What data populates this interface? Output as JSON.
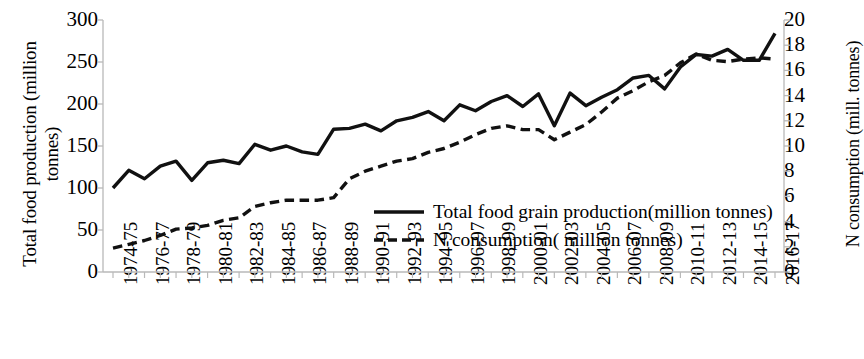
{
  "chart_data": {
    "type": "line",
    "title": "",
    "xlabel": "",
    "ylabel": "Total food production (million tonnes)",
    "y2label": "N consumption (mill. tonnes)",
    "ylim": [
      0,
      300
    ],
    "y2lim": [
      0,
      20
    ],
    "yticks": [
      300,
      250,
      200,
      150,
      100,
      50,
      0
    ],
    "y2ticks": [
      20,
      18,
      16,
      14,
      12,
      10,
      8,
      6,
      4,
      2,
      0
    ],
    "grid": false,
    "legend_position": "center",
    "categories": [
      "1974-75",
      "1975-76",
      "1976-77",
      "1977-78",
      "1978-79",
      "1979-80",
      "1980-81",
      "1981-82",
      "1982-83",
      "1983-84",
      "1984-85",
      "1985-86",
      "1986-87",
      "1987-88",
      "1988-89",
      "1989-90",
      "1990-91",
      "1991-92",
      "1992-93",
      "1993-94",
      "1994-95",
      "1995-96",
      "1996-97",
      "1997-98",
      "1998-99",
      "1999-00",
      "2000-01",
      "2001-02",
      "2002-03",
      "2003-04",
      "2004-05",
      "2005-06",
      "2006-07",
      "2007-08",
      "2008-09",
      "2009-10",
      "2010-11",
      "2011-12",
      "2012-13",
      "2013-14",
      "2014-15",
      "2015-16",
      "2016-17"
    ],
    "xtick_labels": [
      "1974-75",
      "1976-77",
      "1978-79",
      "1980-81",
      "1982-83",
      "1984-85",
      "1986-87",
      "1988-89",
      "1990-91",
      "1992-93",
      "1994-95",
      "1996-97",
      "1998-99",
      "2000-01",
      "2002-03",
      "2004-05",
      "2006-07",
      "2008-09",
      "2010-11",
      "2012-13",
      "2014-15",
      "2016-17"
    ],
    "series": [
      {
        "name": "Total food grain production(million tonnes)",
        "axis": "left",
        "style": "solid",
        "color": "#111111",
        "values": [
          100,
          121,
          111,
          126,
          132,
          109,
          130,
          133,
          129,
          152,
          145,
          150,
          143,
          140,
          170,
          171,
          176,
          168,
          180,
          184,
          191,
          180,
          199,
          192,
          203,
          210,
          197,
          212,
          174,
          213,
          198,
          208,
          217,
          231,
          234,
          218,
          244,
          259,
          257,
          265,
          252,
          252,
          284
        ]
      },
      {
        "name": "N consumption( million tonnes)",
        "axis": "right",
        "style": "dashed",
        "color": "#111111",
        "values": [
          1.9,
          2.2,
          2.5,
          2.9,
          3.4,
          3.5,
          3.7,
          4.1,
          4.3,
          5.2,
          5.5,
          5.7,
          5.7,
          5.7,
          5.9,
          7.4,
          8.0,
          8.4,
          8.8,
          9.0,
          9.5,
          9.8,
          10.3,
          10.9,
          11.4,
          11.6,
          11.3,
          11.3,
          10.5,
          11.1,
          11.7,
          12.7,
          13.8,
          14.4,
          15.1,
          15.6,
          16.6,
          17.3,
          16.8,
          16.7,
          16.9,
          17.0,
          16.9
        ]
      }
    ]
  },
  "legend": {
    "items": [
      {
        "label": "Total food grain production(million tonnes)",
        "style": "solid"
      },
      {
        "label": "N consumption( million tonnes)",
        "style": "dashed"
      }
    ]
  },
  "axes": {
    "left_title_line1": "Total food production (million",
    "left_title_line2": "tonnes)",
    "right_title": "N consumption (mill. tonnes)"
  }
}
